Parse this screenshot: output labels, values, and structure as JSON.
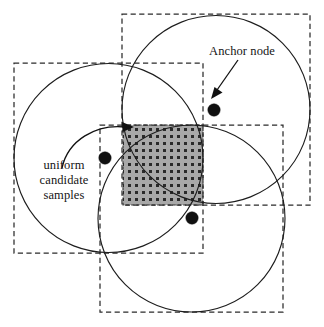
{
  "figure": {
    "title_labels": {
      "anchor_node": "Anchor node",
      "uniform_candidate_samples": "uniform\ncandidate\nsamples"
    },
    "canvas": {
      "width": 324,
      "height": 327,
      "background": "#ffffff"
    },
    "colors": {
      "stroke": "#1d1d1d",
      "dashed_stroke": "#2b2b2b",
      "dot_fill": "#101010",
      "shaded_fill": "#a8a8a8",
      "stipple_dot": "#2a2a2a",
      "text": "#141414"
    },
    "dashed_rectangles": [
      {
        "name": "left-anchor-bounding-box",
        "x": 14,
        "y": 63,
        "width": 189,
        "height": 190
      },
      {
        "name": "top-right-anchor-bounding-box",
        "x": 122,
        "y": 14,
        "width": 188,
        "height": 191
      },
      {
        "name": "bottom-anchor-bounding-box",
        "x": 100,
        "y": 125,
        "width": 183,
        "height": 187
      }
    ],
    "circles": [
      {
        "name": "left-anchor-range-circle",
        "cx": 108.5,
        "cy": 158,
        "r": 94.5
      },
      {
        "name": "top-right-anchor-range-circle",
        "cx": 216,
        "cy": 109.5,
        "r": 94
      },
      {
        "name": "bottom-anchor-range-circle",
        "cx": 191.5,
        "cy": 218.5,
        "r": 93.5
      }
    ],
    "anchor_nodes": [
      {
        "name": "anchor-node-top-right",
        "cx": 214,
        "cy": 110,
        "r": 6.2
      },
      {
        "name": "anchor-node-left",
        "cx": 105,
        "cy": 158,
        "r": 6.2
      },
      {
        "name": "anchor-node-bottom",
        "cx": 192,
        "cy": 218,
        "r": 6.2
      }
    ],
    "shaded_region": {
      "name": "uniform-candidate-sample-region",
      "x": 123,
      "y": 125,
      "width": 80,
      "height": 80,
      "pattern": "stippled-dot-grid",
      "pattern_spacing": 7
    },
    "annotations": [
      {
        "name": "anchor-node-arrow",
        "type": "straight-arrow",
        "from": [
          236,
          62
        ],
        "to": [
          212,
          96
        ]
      },
      {
        "name": "uniform-samples-curved-arrow",
        "type": "curved-arrow",
        "from": [
          63,
          165
        ],
        "to": [
          127,
          127
        ]
      }
    ]
  }
}
